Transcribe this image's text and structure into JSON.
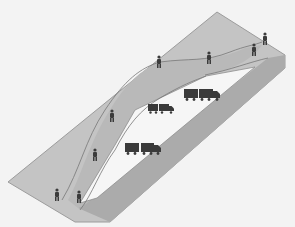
{
  "diagram": {
    "type": "isometric-road-schematic",
    "colors": {
      "background": "#f3f3f3",
      "platform_light": "#c8c8c8",
      "platform_band": "#b8b8b8",
      "platform_dark": "#a9a9a9",
      "edge": "#9a9a9a",
      "hole": "#f7f7f7",
      "path_line": "#7a7a7a",
      "figure": "#3a3a3a"
    },
    "pedestrians": [
      {
        "x": 159,
        "y": 63
      },
      {
        "x": 209,
        "y": 58
      },
      {
        "x": 254,
        "y": 50
      },
      {
        "x": 265,
        "y": 39
      },
      {
        "x": 112,
        "y": 115
      },
      {
        "x": 95,
        "y": 154
      },
      {
        "x": 57,
        "y": 196
      },
      {
        "x": 79,
        "y": 198
      }
    ],
    "trucks": [
      {
        "x": 184,
        "y": 89,
        "trailers": 2
      },
      {
        "x": 148,
        "y": 104,
        "trailers": 1
      },
      {
        "x": 125,
        "y": 143,
        "trailers": 2
      }
    ]
  }
}
